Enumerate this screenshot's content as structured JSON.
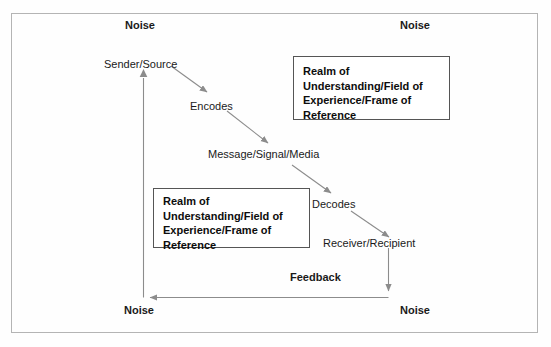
{
  "diagram": {
    "frame": {
      "present": true,
      "border_color": "#b4b4b4"
    },
    "noise_labels": [
      {
        "text": "Noise",
        "position": "top-left"
      },
      {
        "text": "Noise",
        "position": "top-right"
      },
      {
        "text": "Noise",
        "position": "bottom-left"
      },
      {
        "text": "Noise",
        "position": "bottom-right"
      }
    ],
    "chain": [
      {
        "text": "Sender/Source"
      },
      {
        "text": "Encodes"
      },
      {
        "text": "Message/Signal/Media"
      },
      {
        "text": "Decodes"
      },
      {
        "text": "Receiver/Recipient"
      }
    ],
    "realm_boxes": [
      {
        "text": "Realm of\nUnderstanding/Field of\nExperience/Frame of\nReference",
        "position": "upper-right"
      },
      {
        "text": "Realm of\nUnderstanding/Field of\nExperience/Frame of\nReference",
        "position": "lower-left"
      }
    ],
    "feedback": {
      "label": "Feedback"
    },
    "colors": {
      "arrow": "#8c8c8c",
      "text": "#1a1a1a",
      "box_border": "#555555",
      "frame_border": "#b4b4b4",
      "background": "#fefefe"
    }
  }
}
